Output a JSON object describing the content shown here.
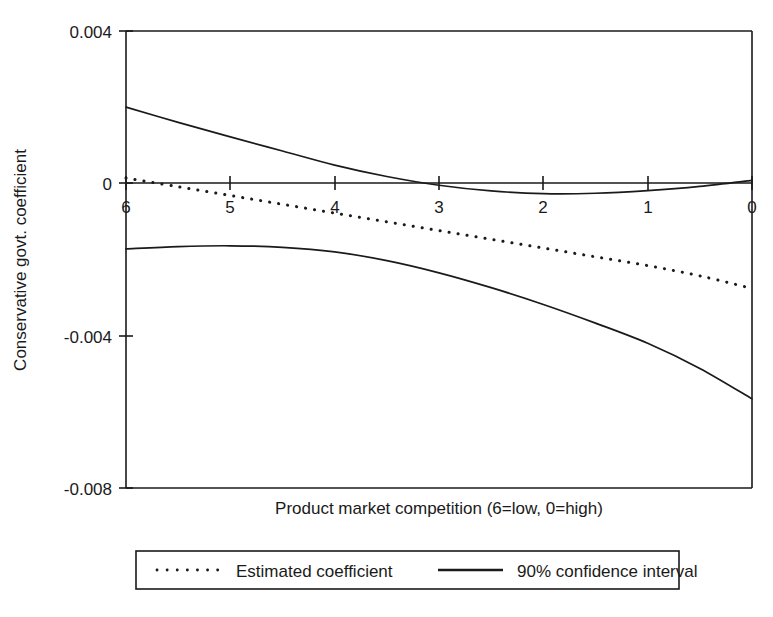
{
  "chart_data": {
    "type": "line",
    "title": "",
    "xlabel": "Product market competition (6=low, 0=high)",
    "ylabel": "Conservative govt. coefficient",
    "xlim": [
      6,
      0
    ],
    "ylim": [
      -0.008,
      0.004
    ],
    "x_ticks": [
      "6",
      "5",
      "4",
      "3",
      "2",
      "1",
      "0"
    ],
    "x_tick_values": [
      6,
      5,
      4,
      3,
      2,
      1,
      0
    ],
    "y_ticks": [
      "0.004",
      "0",
      "-0.004",
      "-0.008"
    ],
    "y_tick_values": [
      0.004,
      0,
      -0.004,
      -0.008
    ],
    "grid": false,
    "zero_line": true,
    "legend_position": "below-outside",
    "x": [
      6,
      5.5,
      5,
      4.5,
      4,
      3.5,
      3,
      2.5,
      2,
      1.5,
      1,
      0.5,
      0
    ],
    "series": [
      {
        "name": "Estimated coefficient",
        "style": "dotted",
        "color": "#1a1a1a",
        "values": [
          0.00014,
          -9e-05,
          -0.00032,
          -0.00055,
          -0.00078,
          -0.00101,
          -0.00124,
          -0.00147,
          -0.0017,
          -0.00193,
          -0.00216,
          -0.00243,
          -0.00276
        ]
      },
      {
        "name": "90% confidence interval upper",
        "style": "solid",
        "color": "#1a1a1a",
        "values": [
          0.002,
          0.0016,
          0.00122,
          0.00085,
          0.00048,
          0.00018,
          -5e-05,
          -0.0002,
          -0.00027,
          -0.00026,
          -0.00019,
          -8e-05,
          8e-05
        ]
      },
      {
        "name": "90% confidence interval lower",
        "style": "solid",
        "color": "#1a1a1a",
        "values": [
          -0.00172,
          -0.00166,
          -0.00164,
          -0.00168,
          -0.0018,
          -0.00203,
          -0.00235,
          -0.00274,
          -0.00318,
          -0.00367,
          -0.0042,
          -0.00486,
          -0.00566
        ]
      }
    ],
    "legend": [
      {
        "label": "Estimated coefficient",
        "style": "dotted"
      },
      {
        "label": "90% confidence interval",
        "style": "solid"
      }
    ]
  },
  "figure": {
    "ylabel": "Conservative govt. coefficient",
    "xlabel": "Product market competition (6=low, 0=high)",
    "y_tick_labels": [
      "0.004",
      "0",
      "-0.004",
      "-0.008"
    ],
    "x_tick_labels": [
      "6",
      "5",
      "4",
      "3",
      "2",
      "1",
      "0"
    ],
    "legend_estimated": "Estimated coefficient",
    "legend_interval": "90% confidence interval"
  }
}
